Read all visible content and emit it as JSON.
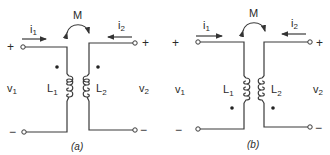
{
  "figure": {
    "panels": [
      {
        "caption": "(a)",
        "mutual": "M",
        "i1": "i",
        "i1_sub": "1",
        "i2": "i",
        "i2_sub": "2",
        "v1": "v",
        "v1_sub": "1",
        "v2": "v",
        "v2_sub": "2",
        "L1": "L",
        "L1_sub": "1",
        "L2": "L",
        "L2_sub": "2",
        "plus": "+",
        "minus": "−",
        "dot_position": "top"
      },
      {
        "caption": "(b)",
        "mutual": "M",
        "i1": "i",
        "i1_sub": "1",
        "i2": "i",
        "i2_sub": "2",
        "v1": "v",
        "v1_sub": "1",
        "v2": "v",
        "v2_sub": "2",
        "L1": "L",
        "L1_sub": "1",
        "L2": "L",
        "L2_sub": "2",
        "plus": "+",
        "minus": "−",
        "dot_position": "bottom"
      }
    ]
  }
}
